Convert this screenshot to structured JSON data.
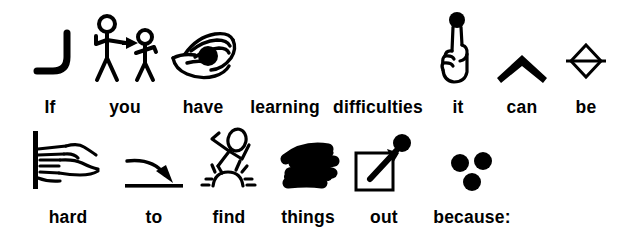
{
  "document": {
    "type": "pictogram-sentence",
    "ink_color": "#000000",
    "background_color": "#ffffff",
    "full_text": "If you have learning difficulties it can be hard to find things out because:"
  },
  "lines": [
    {
      "id": "line-1",
      "words": [
        {
          "word": "If",
          "icon": "curved-hook-icon",
          "has_icon": true
        },
        {
          "word": "you",
          "icon": "two-stick-figures-pointing-icon",
          "has_icon": true
        },
        {
          "word": "have",
          "icon": "hands-holding-ball-icon",
          "has_icon": true
        },
        {
          "word": "learning",
          "icon": "",
          "has_icon": false
        },
        {
          "word": "difficulties",
          "icon": "",
          "has_icon": false
        },
        {
          "word": "it",
          "icon": "pointing-finger-dot-icon",
          "has_icon": true
        },
        {
          "word": "can",
          "icon": "up-chevron-icon",
          "has_icon": true
        },
        {
          "word": "be",
          "icon": "diamond-with-line-icon",
          "has_icon": true
        }
      ]
    },
    {
      "id": "line-2",
      "words": [
        {
          "word": "hard",
          "icon": "hand-gripping-bar-icon",
          "has_icon": true
        },
        {
          "word": "to",
          "icon": "curved-arrow-to-line-icon",
          "has_icon": true
        },
        {
          "word": "find",
          "icon": "figure-over-sunburst-icon",
          "has_icon": true
        },
        {
          "word": "things",
          "icon": "scribble-icon",
          "has_icon": true
        },
        {
          "word": "out",
          "icon": "square-with-exit-arrow-icon",
          "has_icon": true
        },
        {
          "word": "because:",
          "icon": "three-dots-icon",
          "has_icon": true
        }
      ]
    }
  ]
}
